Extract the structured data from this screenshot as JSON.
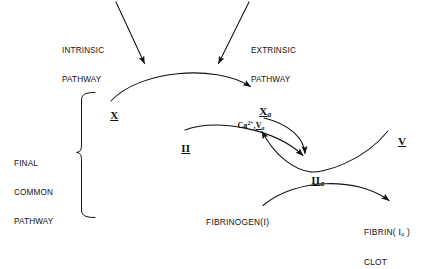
{
  "diagram": {
    "ink_color": "#111111",
    "background_color": "#ffffff",
    "inputs": {
      "intrinsic": {
        "line1": "INTRINSIC",
        "line2": "PATHWAY"
      },
      "extrinsic": {
        "line1": "EXTRINSIC",
        "line2": "PATHWAY"
      }
    },
    "bracket_label": {
      "line1": "FINAL",
      "line2": "COMMON",
      "line3": "PATHWAY"
    },
    "nodes": {
      "factor_x": {
        "numeral": "X",
        "subscript": ""
      },
      "factor_xa": {
        "numeral": "X",
        "subscript": "a"
      },
      "factor_ii": {
        "numeral": "II",
        "subscript": ""
      },
      "factor_iia": {
        "numeral": "II",
        "subscript": "a"
      },
      "factor_v": {
        "numeral": "V",
        "subscript": ""
      },
      "cofactor_complex": {
        "calcium": "Ca",
        "calcium_charge": "2+",
        "separator": ",",
        "numeral": "V",
        "subscript": "a"
      },
      "fibrinogen": {
        "name": "FIBRINOGEN",
        "open_paren": "(",
        "numeral": "I",
        "close_paren": ")"
      },
      "fibrin": {
        "name": "FIBRIN",
        "open_paren": "( ",
        "numeral": "I",
        "subscript": "a",
        "close_paren": " )",
        "line2": "CLOT"
      }
    },
    "arrows": [
      {
        "name": "intrinsic-input-arrow",
        "kind": "straight",
        "from": "INTRINSIC PATHWAY",
        "to": "X to Xa arc"
      },
      {
        "name": "extrinsic-input-arrow",
        "kind": "straight",
        "from": "EXTRINSIC PATHWAY",
        "to": "X to Xa arc"
      },
      {
        "name": "x-to-xa-arrow",
        "kind": "curved",
        "from": "X",
        "to": "Xa"
      },
      {
        "name": "ii-to-iia-arrow",
        "kind": "curved",
        "from": "II",
        "to": "IIa"
      },
      {
        "name": "xa-to-iia-arrow",
        "kind": "curved",
        "from": "Xa",
        "to": "IIa"
      },
      {
        "name": "v-to-complex-arrow",
        "kind": "curved",
        "from": "V",
        "to": "Ca2+,Va"
      },
      {
        "name": "fibrinogen-to-fibrin-arrow",
        "kind": "curved",
        "from": "FIBRINOGEN(I)",
        "to": "FIBRIN(Ia) CLOT"
      }
    ]
  }
}
